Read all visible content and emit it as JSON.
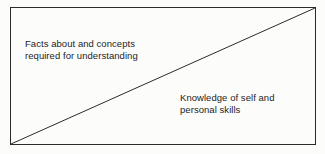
{
  "diagram": {
    "type": "divided-rectangle",
    "frame": {
      "border_color": "#2b2b2b",
      "border_width_px": 1,
      "left_px": 10,
      "top_px": 7,
      "width_px": 306,
      "height_px": 138
    },
    "divider": {
      "name": "diagonal-line",
      "color": "#2b2b2b",
      "width_px": 1,
      "from": {
        "x": 11,
        "y": 144
      },
      "to": {
        "x": 315,
        "y": 8
      },
      "description": "straight line from bottom-left corner to top-right corner"
    },
    "background_color": "#fcfcfb",
    "text_color": "#1d1d1d"
  },
  "regions": [
    {
      "name": "upper-left-region",
      "position": "above-diagonal",
      "lines": [
        "Facts about and concepts",
        "required for understanding"
      ]
    },
    {
      "name": "lower-right-region",
      "position": "below-diagonal",
      "lines": [
        "Knowledge of self and",
        "personal skills"
      ]
    }
  ]
}
